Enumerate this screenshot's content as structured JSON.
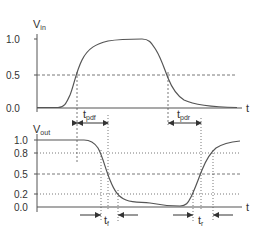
{
  "top_plot": {
    "y_label": "V",
    "y_label_sub": "in",
    "x_label": "t",
    "ticks": [
      "1.0",
      "0.5",
      "0.0"
    ]
  },
  "bottom_plot": {
    "y_label": "V",
    "y_label_sub": "out",
    "x_label": "t",
    "ticks": [
      "1.0",
      "0.8",
      "0.5",
      "0.2",
      "0.0"
    ]
  },
  "annotations": {
    "tpdf": {
      "main": "t",
      "sub": "pdf"
    },
    "tpdr": {
      "main": "t",
      "sub": "pdr"
    },
    "tf": {
      "main": "t",
      "sub": "f"
    },
    "tr": {
      "main": "t",
      "sub": "r"
    }
  },
  "colors": {
    "curve": "#555555",
    "axis": "#555555",
    "text": "#333333"
  }
}
